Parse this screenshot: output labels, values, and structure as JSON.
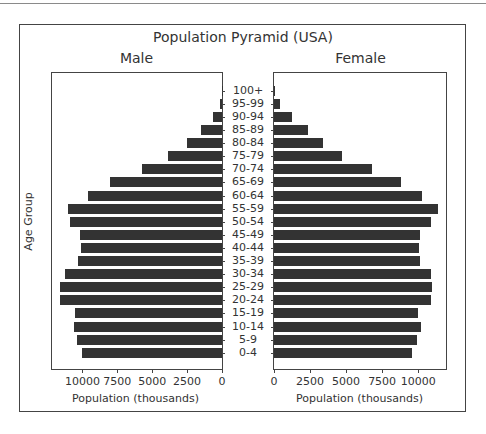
{
  "chart_data": {
    "type": "bar",
    "orientation": "horizontal",
    "title": "Population Pyramid (USA)",
    "subplots": [
      "Male",
      "Female"
    ],
    "ylabel": "Age Group",
    "xlabel": "Population (thousands)",
    "categories": [
      "100+",
      "95-99",
      "90-94",
      "85-89",
      "80-84",
      "75-79",
      "70-74",
      "65-69",
      "60-64",
      "55-59",
      "50-54",
      "45-49",
      "40-44",
      "35-39",
      "30-34",
      "25-29",
      "20-24",
      "15-19",
      "10-14",
      "5-9",
      "0-4"
    ],
    "series": [
      {
        "name": "Male",
        "values": [
          30,
          150,
          630,
          1490,
          2500,
          3840,
          5760,
          7990,
          9570,
          11000,
          10860,
          10140,
          10070,
          10290,
          11220,
          11600,
          11600,
          10500,
          10600,
          10410,
          10020
        ]
      },
      {
        "name": "Female",
        "values": [
          70,
          400,
          1270,
          2380,
          3430,
          4700,
          6830,
          8840,
          10250,
          11410,
          10920,
          10140,
          10090,
          10140,
          10880,
          10970,
          10920,
          10020,
          10210,
          9950,
          9540
        ]
      }
    ],
    "male_xticks": [
      "10000",
      "7500",
      "5000",
      "2500",
      "0"
    ],
    "female_xticks": [
      "0",
      "2500",
      "5000",
      "7500",
      "10000"
    ],
    "male_xlim": [
      12250,
      0
    ],
    "female_xlim": [
      0,
      12000
    ],
    "grid": false,
    "bar_color": "#333333"
  }
}
